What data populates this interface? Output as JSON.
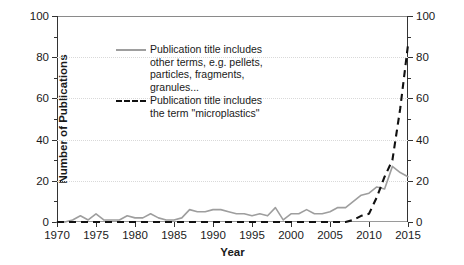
{
  "chart_data": {
    "type": "line",
    "title": "",
    "xlabel": "Year",
    "ylabel": "Number of Publications",
    "xlim": [
      1970,
      2015
    ],
    "ylim": [
      0,
      100
    ],
    "xticks": [
      1970,
      1975,
      1980,
      1985,
      1990,
      1995,
      2000,
      2005,
      2010,
      2015
    ],
    "yticks": [
      0,
      20,
      40,
      60,
      80,
      100
    ],
    "y_right_ticks": [
      0,
      20,
      40,
      60,
      80,
      100
    ],
    "grid": "horizontal-dotted",
    "legend_position": "upper-left-inside",
    "x": [
      1970,
      1971,
      1972,
      1973,
      1974,
      1975,
      1976,
      1977,
      1978,
      1979,
      1980,
      1981,
      1982,
      1983,
      1984,
      1985,
      1986,
      1987,
      1988,
      1989,
      1990,
      1991,
      1992,
      1993,
      1994,
      1995,
      1996,
      1997,
      1998,
      1999,
      2000,
      2001,
      2002,
      2003,
      2004,
      2005,
      2006,
      2007,
      2008,
      2009,
      2010,
      2011,
      2012,
      2013,
      2014,
      2015
    ],
    "series": [
      {
        "name": "Publication title includes other terms, e.g. pellets, particles, fragments, granules...",
        "style": "solid",
        "color": "#9e9e9e",
        "values": [
          0,
          0,
          1,
          3,
          1,
          4,
          1,
          1,
          1,
          3,
          2,
          2,
          4,
          2,
          1,
          1,
          2,
          6,
          5,
          5,
          6,
          6,
          5,
          4,
          4,
          3,
          4,
          3,
          7,
          1,
          4,
          4,
          6,
          4,
          4,
          5,
          7,
          7,
          10,
          13,
          14,
          17,
          16,
          27,
          24,
          22
        ]
      },
      {
        "name": "Publication title includes the term \"microplastics\"",
        "style": "dashed",
        "color": "#111111",
        "values": [
          0,
          0,
          0,
          0,
          0,
          0,
          0,
          0,
          0,
          0,
          0,
          0,
          0,
          0,
          0,
          0,
          0,
          0,
          0,
          0,
          0,
          0,
          0,
          0,
          0,
          0,
          0,
          0,
          0,
          0,
          0,
          0,
          0,
          0,
          0,
          0,
          0,
          0,
          1,
          3,
          4,
          12,
          22,
          30,
          55,
          86
        ]
      }
    ]
  },
  "axes": {
    "x_title": "Year",
    "y_title": "Number of Publications",
    "x_tick_labels": [
      "1970",
      "1975",
      "1980",
      "1985",
      "1990",
      "1995",
      "2000",
      "2005",
      "2010",
      "2015"
    ],
    "y_tick_labels": [
      "0",
      "20",
      "40",
      "60",
      "80",
      "100"
    ],
    "y_right_tick_labels": [
      "0",
      "20",
      "40",
      "60",
      "80",
      "100"
    ]
  },
  "legend": {
    "entries": [
      {
        "style": "solid",
        "lines": [
          "Publication title includes",
          "other terms, e.g. pellets,",
          "particles, fragments,",
          "granules..."
        ]
      },
      {
        "style": "dashed",
        "lines": [
          "Publication title includes",
          "the term \"microplastics\""
        ]
      }
    ]
  },
  "colors": {
    "series_solid": "#9e9e9e",
    "series_dashed": "#111111",
    "grid": "#d9d9d9",
    "axis": "#333333",
    "background": "#ffffff"
  }
}
